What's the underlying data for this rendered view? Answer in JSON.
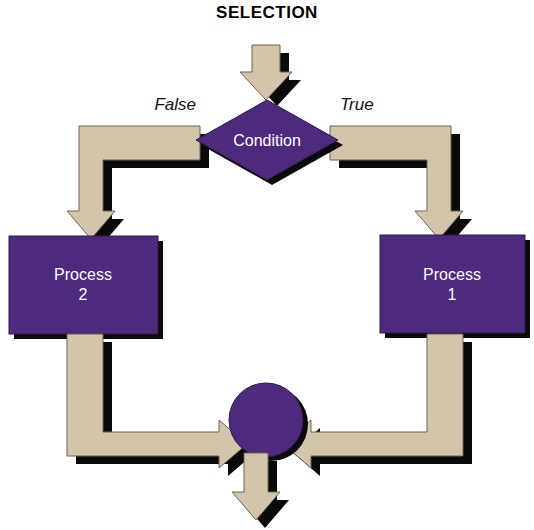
{
  "diagram": {
    "title": "SELECTION",
    "type": "flowchart",
    "palette": {
      "arrow_fill": "#d3c5ab",
      "node_fill": "#4e2a7e",
      "shadow": "#0a0a0a",
      "node_text": "#ffffff",
      "background": "#ffffff",
      "title_text": "#000000"
    },
    "nodes": {
      "condition": {
        "label": "Condition",
        "shape": "diamond",
        "name": "condition-diamond"
      },
      "process_left": {
        "label_line1": "Process",
        "label_line2": "2",
        "shape": "rectangle",
        "name": "process-2-box"
      },
      "process_right": {
        "label_line1": "Process",
        "label_line2": "1",
        "shape": "rectangle",
        "name": "process-1-box"
      },
      "merge": {
        "label": "",
        "shape": "circle",
        "name": "merge-circle"
      }
    },
    "branch_labels": {
      "false": "False",
      "true": "True"
    },
    "arrows": [
      {
        "name": "entry-arrow-down",
        "direction": "down"
      },
      {
        "name": "false-branch-elbow",
        "direction": "left-then-down"
      },
      {
        "name": "true-branch-elbow",
        "direction": "right-then-down"
      },
      {
        "name": "process-2-to-merge",
        "direction": "down-then-right"
      },
      {
        "name": "process-1-to-merge",
        "direction": "down-then-left"
      },
      {
        "name": "exit-arrow-down",
        "direction": "down"
      }
    ]
  }
}
